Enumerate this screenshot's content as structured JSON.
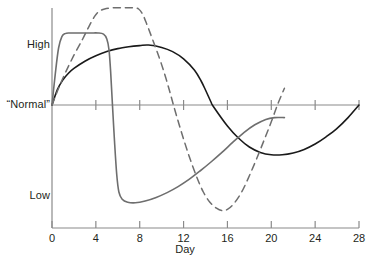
{
  "chart_data": {
    "type": "line",
    "title": "",
    "xlabel": "Day",
    "ylabel": "",
    "xlim": [
      0,
      28
    ],
    "x_ticks": [
      0,
      4,
      8,
      12,
      16,
      20,
      24,
      28
    ],
    "x_tick_labels": [
      "0",
      "4",
      "8",
      "12",
      "16",
      "20",
      "24",
      "28"
    ],
    "y_tick_labels": [
      "High",
      "“Normal”",
      "Low"
    ],
    "y_levels": {
      "high": "High",
      "normal": "“Normal”",
      "low": "Low"
    },
    "grid": false,
    "legend": "none",
    "baseline_label": "“Normal”",
    "series": [
      {
        "name": "black-solid-curve",
        "style": "solid",
        "color": "#1a1a1a",
        "points": [
          [
            0.0,
            0.0
          ],
          [
            0.5,
            0.26
          ],
          [
            1.0,
            0.42
          ],
          [
            1.5,
            0.53
          ],
          [
            2.0,
            0.61
          ],
          [
            3.0,
            0.73
          ],
          [
            4.0,
            0.82
          ],
          [
            5.0,
            0.89
          ],
          [
            6.0,
            0.94
          ],
          [
            7.0,
            0.97
          ],
          [
            8.0,
            0.99
          ],
          [
            8.8,
            1.0
          ],
          [
            10.0,
            0.96
          ],
          [
            11.0,
            0.89
          ],
          [
            12.0,
            0.77
          ],
          [
            13.0,
            0.58
          ],
          [
            13.6,
            0.4
          ],
          [
            14.0,
            0.25
          ],
          [
            14.5,
            0.05
          ],
          [
            14.7,
            -0.02
          ],
          [
            16.0,
            -0.35
          ],
          [
            17.0,
            -0.55
          ],
          [
            18.0,
            -0.7
          ],
          [
            19.0,
            -0.79
          ],
          [
            20.0,
            -0.83
          ],
          [
            21.0,
            -0.83
          ],
          [
            22.0,
            -0.8
          ],
          [
            23.0,
            -0.74
          ],
          [
            24.0,
            -0.65
          ],
          [
            25.0,
            -0.53
          ],
          [
            26.0,
            -0.39
          ],
          [
            27.0,
            -0.21
          ],
          [
            28.0,
            0.0
          ]
        ]
      },
      {
        "name": "gray-solid-curve",
        "style": "solid",
        "color": "#6e6e6e",
        "points": [
          [
            0.0,
            0.0
          ],
          [
            0.3,
            0.52
          ],
          [
            0.6,
            0.95
          ],
          [
            0.9,
            1.14
          ],
          [
            1.2,
            1.19
          ],
          [
            1.6,
            1.2
          ],
          [
            2.5,
            1.2
          ],
          [
            3.5,
            1.2
          ],
          [
            4.2,
            1.2
          ],
          [
            4.7,
            1.18
          ],
          [
            5.0,
            1.1
          ],
          [
            5.2,
            0.92
          ],
          [
            5.35,
            0.55
          ],
          [
            5.5,
            0.05
          ],
          [
            5.7,
            -0.6
          ],
          [
            5.9,
            -1.15
          ],
          [
            6.1,
            -1.45
          ],
          [
            6.4,
            -1.57
          ],
          [
            6.9,
            -1.62
          ],
          [
            7.6,
            -1.63
          ],
          [
            8.5,
            -1.6
          ],
          [
            9.5,
            -1.54
          ],
          [
            10.5,
            -1.46
          ],
          [
            11.5,
            -1.36
          ],
          [
            12.5,
            -1.24
          ],
          [
            13.5,
            -1.1
          ],
          [
            14.5,
            -0.95
          ],
          [
            15.5,
            -0.79
          ],
          [
            16.5,
            -0.62
          ],
          [
            17.5,
            -0.46
          ],
          [
            18.5,
            -0.33
          ],
          [
            19.5,
            -0.24
          ],
          [
            20.3,
            -0.21
          ],
          [
            21.2,
            -0.21
          ]
        ]
      },
      {
        "name": "gray-dashed-curve",
        "style": "dashed",
        "color": "#6e6e6e",
        "points": [
          [
            0.0,
            0.0
          ],
          [
            0.6,
            0.28
          ],
          [
            1.2,
            0.53
          ],
          [
            2.0,
            0.83
          ],
          [
            2.8,
            1.1
          ],
          [
            3.4,
            1.32
          ],
          [
            3.9,
            1.48
          ],
          [
            4.3,
            1.56
          ],
          [
            4.8,
            1.6
          ],
          [
            5.6,
            1.62
          ],
          [
            6.6,
            1.62
          ],
          [
            7.4,
            1.62
          ],
          [
            7.9,
            1.6
          ],
          [
            8.3,
            1.5
          ],
          [
            8.7,
            1.32
          ],
          [
            9.2,
            1.08
          ],
          [
            9.8,
            0.78
          ],
          [
            10.3,
            0.5
          ],
          [
            10.7,
            0.25
          ],
          [
            11.0,
            0.05
          ],
          [
            11.2,
            -0.08
          ],
          [
            11.8,
            -0.45
          ],
          [
            12.5,
            -0.85
          ],
          [
            13.2,
            -1.2
          ],
          [
            13.8,
            -1.45
          ],
          [
            14.4,
            -1.62
          ],
          [
            15.0,
            -1.72
          ],
          [
            15.5,
            -1.76
          ],
          [
            16.0,
            -1.74
          ],
          [
            16.6,
            -1.64
          ],
          [
            17.3,
            -1.45
          ],
          [
            18.0,
            -1.18
          ],
          [
            18.7,
            -0.88
          ],
          [
            19.4,
            -0.56
          ],
          [
            20.0,
            -0.28
          ],
          [
            20.6,
            0.02
          ],
          [
            21.2,
            0.28
          ]
        ]
      }
    ]
  },
  "axes": {
    "y_axis_name": "y-axis",
    "x_axis_name": "x-axis"
  }
}
